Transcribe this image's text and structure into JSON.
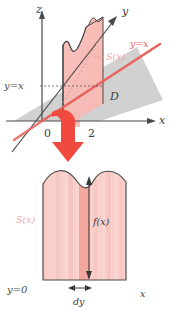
{
  "figure": {
    "top_panel": {
      "name": "3d-axes-diagram",
      "axes": [
        {
          "id": "z",
          "label": "z",
          "direction": "up"
        },
        {
          "id": "y",
          "label": "y",
          "direction": "up-right"
        },
        {
          "id": "x",
          "label": "x",
          "direction": "right"
        }
      ],
      "tick_labels": [
        "0",
        "2"
      ],
      "line_label_red": "y=x",
      "guide_label": "y=x",
      "region_label": "D",
      "slice_label": "S(x)",
      "colors": {
        "slice_fill": "#f7b9b4",
        "region_fill": "#c8c8c8",
        "line_red": "#e8635e",
        "axis": "#4a4a4a",
        "outline": "#3a3a3a",
        "arrow_red": "#f04a3f"
      }
    },
    "transition": {
      "name": "projection-arrow",
      "icon": "down-arrow-icon",
      "color": "#f04a3f"
    },
    "bottom_panel": {
      "name": "cross-section-diagram",
      "area_label": "S(x)",
      "height_label": "f(x)",
      "width_label": "dy",
      "baseline_label": "y=0",
      "axis_label": "x",
      "colors": {
        "fill_light": "#fbd6d2",
        "fill_mid": "#f8c3bd",
        "fill_dark": "#f3a49c",
        "stripe": "#f6c2bc",
        "outline": "#4a4a4a",
        "label_pink": "#f3a9a4"
      }
    }
  }
}
